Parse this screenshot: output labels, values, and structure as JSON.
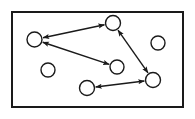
{
  "figure": {
    "title": "",
    "caption": "",
    "type": "node-link-diagram",
    "width": 195,
    "height": 119,
    "background_color": "#ffffff"
  },
  "frame": {
    "name": "outer-border-rectangle",
    "x": 12,
    "y": 12,
    "width": 171,
    "height": 95,
    "stroke_color": "#1a1a1a",
    "stroke_width": 2,
    "fill_color": "#ffffff"
  },
  "style": {
    "node_stroke_color": "#1a1a1a",
    "node_fill_color": "#ffffff",
    "node_stroke_width": 1.4,
    "edge_stroke_color": "#1a1a1a",
    "edge_stroke_width": 1.4,
    "arrowhead": "filled-triangle-both-ends"
  },
  "graph": {
    "node_count": 8,
    "edge_count": 4,
    "nodes": [
      {
        "id": "n1",
        "label": "",
        "cx": 34.5,
        "cy": 39.5,
        "r": 7.5,
        "connected": true
      },
      {
        "id": "n2",
        "label": "",
        "cx": 113.0,
        "cy": 23.0,
        "r": 7.5,
        "connected": true
      },
      {
        "id": "n3",
        "label": "",
        "cx": 158.0,
        "cy": 43.0,
        "r": 7.0,
        "connected": false
      },
      {
        "id": "n4",
        "label": "",
        "cx": 48.0,
        "cy": 70.0,
        "r": 7.0,
        "connected": false
      },
      {
        "id": "n5",
        "label": "",
        "cx": 117.0,
        "cy": 67.0,
        "r": 7.0,
        "connected": true
      },
      {
        "id": "n6",
        "label": "",
        "cx": 153.0,
        "cy": 80.0,
        "r": 7.5,
        "connected": true
      },
      {
        "id": "n7",
        "label": "",
        "cx": 87.0,
        "cy": 88.0,
        "r": 7.5,
        "connected": true
      },
      {
        "id": "n8",
        "label": "",
        "cx": 34.5,
        "cy": 39.5,
        "r": 0.0,
        "connected": false
      }
    ],
    "edges": [
      {
        "id": "e1",
        "from": "n1",
        "to": "n2",
        "label": "",
        "directed": "both"
      },
      {
        "id": "e2",
        "from": "n1",
        "to": "n5",
        "label": "",
        "directed": "both"
      },
      {
        "id": "e3",
        "from": "n2",
        "to": "n6",
        "label": "",
        "directed": "both"
      },
      {
        "id": "e4",
        "from": "n7",
        "to": "n6",
        "label": "",
        "directed": "both"
      }
    ]
  }
}
